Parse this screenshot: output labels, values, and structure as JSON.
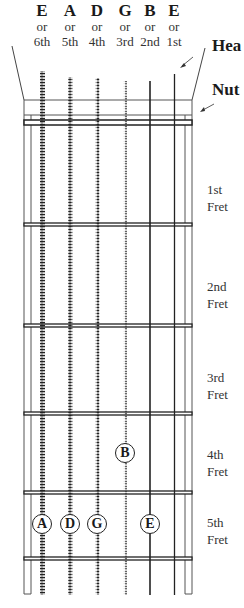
{
  "strings": [
    {
      "note": "E",
      "or": "or",
      "number": "6th"
    },
    {
      "note": "A",
      "or": "or",
      "number": "5th"
    },
    {
      "note": "D",
      "or": "or",
      "number": "4th"
    },
    {
      "note": "G",
      "or": "or",
      "number": "3rd"
    },
    {
      "note": "B",
      "or": "or",
      "number": "2nd"
    },
    {
      "note": "E",
      "or": "or",
      "number": "1st"
    }
  ],
  "labels": {
    "headstock": "Hea",
    "nut": "Nut"
  },
  "frets": [
    {
      "ordinal": "1st",
      "word": "Fret"
    },
    {
      "ordinal": "2nd",
      "word": "Fret"
    },
    {
      "ordinal": "3rd",
      "word": "Fret"
    },
    {
      "ordinal": "4th",
      "word": "Fret"
    },
    {
      "ordinal": "5th",
      "word": "Fret"
    }
  ],
  "markers": [
    {
      "note": "B",
      "string": "3rd (G)",
      "fret": 4
    },
    {
      "note": "A",
      "string": "6th (E)",
      "fret": 5
    },
    {
      "note": "D",
      "string": "5th (A)",
      "fret": 5
    },
    {
      "note": "G",
      "string": "4th (D)",
      "fret": 5
    },
    {
      "note": "E",
      "string": "2nd (B)",
      "fret": 5
    }
  ]
}
